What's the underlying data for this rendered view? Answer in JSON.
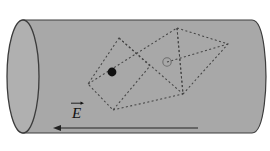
{
  "figure": {
    "canvas": {
      "width": 270,
      "height": 151,
      "background": "#ffffff"
    },
    "colors": {
      "cylinder_fill": "#a8a8a8",
      "cylinder_end_fill": "#b0b0b0",
      "outline": "#3c3c3c",
      "dash_stroke": "#444444",
      "dot_fill": "#111111",
      "open_circle_stroke": "#6f6f6f",
      "arrow_stroke": "#222222",
      "label_color": "#111111"
    },
    "cylinder": {
      "name": "gaussian-cylinder",
      "body_top_y": 20,
      "body_bottom_y": 133,
      "left_x": 23,
      "right_x": 252,
      "end_cap_rx": 16,
      "end_cap_ry": 56.5,
      "right_bulge": 14
    },
    "quadrilateral": {
      "name": "dashed-quadrilateral",
      "points": "119,38 150,66 113,110 88,84",
      "dash": "2,2.4"
    },
    "triangle": {
      "name": "dashed-triangle",
      "points": "177,28 228,44 183,94",
      "dash": "2,2.4"
    },
    "extra_segments": [
      {
        "name": "diagonal-quad-to-triangle",
        "x1": 88,
        "y1": 84,
        "x2": 177,
        "y2": 28
      },
      {
        "name": "diagonal-quad-to-bottom",
        "x1": 119,
        "y1": 38,
        "x2": 183,
        "y2": 94
      },
      {
        "name": "median-circle-to-right",
        "x1": 167,
        "y1": 62,
        "x2": 228,
        "y2": 44
      },
      {
        "name": "vertical-median",
        "x1": 177,
        "y1": 28,
        "x2": 183,
        "y2": 94
      },
      {
        "name": "quad-bottom-extension",
        "x1": 113,
        "y1": 110,
        "x2": 183,
        "y2": 94
      }
    ],
    "filled_dot": {
      "name": "charge-point-filled",
      "cx": 112,
      "cy": 72,
      "r": 4.4,
      "description": "filled black charge point"
    },
    "open_circle": {
      "name": "charge-point-open",
      "cx": 167,
      "cy": 62,
      "r": 4.2,
      "description": "open grey circle charge point"
    },
    "field_arrow": {
      "name": "electric-field-arrow",
      "tail_x": 198,
      "tail_y": 128,
      "head_x": 53,
      "head_y": 128,
      "head_size": 6,
      "direction": "left"
    },
    "field_label": {
      "name": "electric-field-label",
      "text": "E",
      "vector_notation": "arrow-over",
      "x": 71,
      "y": 106
    }
  }
}
